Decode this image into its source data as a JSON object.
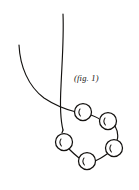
{
  "figure": {
    "caption": "(fig. 1)",
    "caption_position": {
      "x": 74,
      "y": 74
    },
    "medium": "hand-drawn ink line sketch",
    "background_color": "#ffffff",
    "ink_color": "#141210",
    "canvas": {
      "width": 139,
      "height": 190
    }
  },
  "chart_data": {
    "type": "diagram",
    "title": "(fig. 1)",
    "threads": [
      {
        "name": "vertical-thread",
        "path": "M 63 14 C 64 38, 62 62, 61 86 C 60 104, 60 118, 63 130",
        "start": {
          "x": 63,
          "y": 14
        },
        "end": {
          "x": 63,
          "y": 130
        }
      },
      {
        "name": "left-arc-thread",
        "path": "M 19 45 C 20 66, 28 86, 44 98 C 56 106, 68 110, 76 112",
        "start": {
          "x": 19,
          "y": 45
        },
        "end": {
          "x": 76,
          "y": 112
        }
      }
    ],
    "crossing_point": {
      "x": 62,
      "y": 104
    },
    "beads": [
      {
        "id": "bead-1",
        "label": "top-left",
        "cx": 83,
        "cy": 112,
        "r": 8.5
      },
      {
        "id": "bead-2",
        "label": "top-right",
        "cx": 108,
        "cy": 121,
        "r": 8.5
      },
      {
        "id": "bead-3",
        "label": "right",
        "cx": 114,
        "cy": 148,
        "r": 8.5
      },
      {
        "id": "bead-4",
        "label": "bottom",
        "cx": 87,
        "cy": 161,
        "r": 8.5
      },
      {
        "id": "bead-5",
        "label": "left",
        "cx": 64,
        "cy": 142,
        "r": 8.5
      }
    ],
    "bead_count": 5,
    "connectors": [
      {
        "from": "bead-1",
        "to": "bead-2",
        "path": "M 91 115 C 96 117, 100 119, 100 120"
      },
      {
        "from": "bead-2",
        "to": "bead-3",
        "path": "M 115 126 C 119 133, 118 140, 116 141"
      },
      {
        "from": "bead-3",
        "to": "bead-4",
        "path": "M 107 154 C 100 159, 95 161, 95 161"
      },
      {
        "from": "bead-4",
        "to": "bead-5",
        "path": "M 79 158 C 74 154, 70 150, 69 149"
      },
      {
        "from": "bead-5",
        "to": "thread",
        "path": "M 62 133 C 62 132, 63 131, 63 130"
      }
    ]
  }
}
